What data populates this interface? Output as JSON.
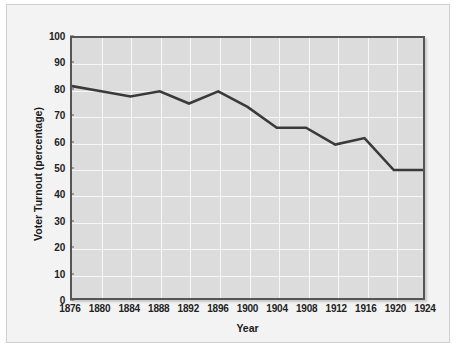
{
  "chart_data": {
    "type": "line",
    "title": "",
    "xlabel": "Year",
    "ylabel": "Voter Turnout (percentage)",
    "xlim": [
      1876,
      1924
    ],
    "ylim": [
      0,
      100
    ],
    "grid": true,
    "legend": "none",
    "x": [
      1876,
      1880,
      1884,
      1888,
      1892,
      1896,
      1900,
      1904,
      1908,
      1912,
      1916,
      1920,
      1924
    ],
    "xtick_labels": [
      "1876",
      "1880",
      "1884",
      "1888",
      "1892",
      "1896",
      "1900",
      "1904",
      "1908",
      "1912",
      "1916",
      "1920",
      "1924"
    ],
    "ytick_labels": [
      "0",
      "10",
      "20",
      "30",
      "40",
      "50",
      "60",
      "70",
      "80",
      "90",
      "100"
    ],
    "yticks": [
      0,
      10,
      20,
      30,
      40,
      50,
      60,
      70,
      80,
      90,
      100
    ],
    "series": [
      {
        "name": "Voter Turnout",
        "values": [
          81.5,
          79.5,
          77.5,
          79.5,
          74.8,
          79.5,
          73.5,
          65.5,
          65.5,
          59.0,
          61.5,
          49.2,
          49.2
        ],
        "color": "#3a3a3a"
      }
    ]
  },
  "style": {
    "plot_background": "#dcdcdc",
    "page_background": "#f3f3f3",
    "grid_color": "#f7f7f7",
    "axis_color": "#555555",
    "text_color": "#1a1a1a"
  }
}
